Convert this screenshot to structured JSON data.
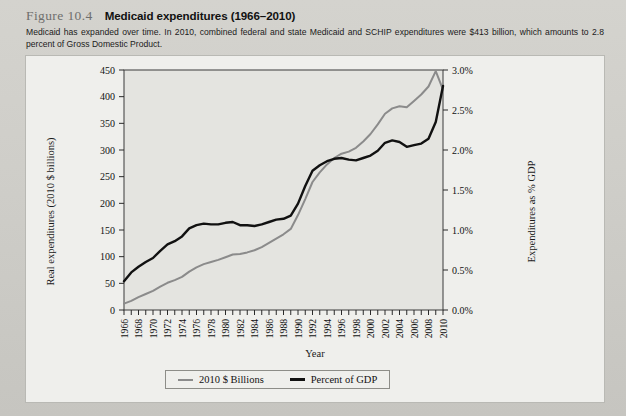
{
  "figure": {
    "number": "Figure 10.4",
    "title": "Medicaid expenditures (1966–2010)",
    "caption": "Medicaid has expanded over time. In 2010, combined federal and state Medicaid and SCHIP expenditures were $413 billion, which amounts to 2.8 percent of Gross Domestic Product."
  },
  "chart_data": {
    "type": "line",
    "title": "Medicaid expenditures (1966–2010)",
    "xlabel": "Year",
    "ylabel": "Real expenditures (2010 $ billions)",
    "y2label": "Expenditures as % GDP",
    "grid": false,
    "legend_position": "bottom",
    "xlim": [
      1966,
      2010
    ],
    "ylim": [
      0,
      450
    ],
    "y2lim": [
      0,
      3.0
    ],
    "yticks": [
      0,
      50,
      100,
      150,
      200,
      250,
      300,
      350,
      400,
      450
    ],
    "ytick_labels": [
      "0",
      "50",
      "100",
      "150",
      "200",
      "250",
      "300",
      "350",
      "400",
      "450"
    ],
    "y2ticks": [
      0,
      0.5,
      1.0,
      1.5,
      2.0,
      2.5,
      3.0
    ],
    "y2tick_labels": [
      "0.0%",
      "0.5%",
      "1.0%",
      "1.5%",
      "2.0%",
      "2.5%",
      "3.0%"
    ],
    "x": [
      1966,
      1967,
      1968,
      1969,
      1970,
      1971,
      1972,
      1973,
      1974,
      1975,
      1976,
      1977,
      1978,
      1979,
      1980,
      1981,
      1982,
      1983,
      1984,
      1985,
      1986,
      1987,
      1988,
      1989,
      1990,
      1991,
      1992,
      1993,
      1994,
      1995,
      1996,
      1997,
      1998,
      1999,
      2000,
      2001,
      2002,
      2003,
      2004,
      2005,
      2006,
      2007,
      2008,
      2009,
      2010
    ],
    "xtick_labels": [
      "1966",
      "1968",
      "1970",
      "1972",
      "1974",
      "1976",
      "1978",
      "1980",
      "1982",
      "1984",
      "1986",
      "1988",
      "1990",
      "1992",
      "1994",
      "1996",
      "1998",
      "2000",
      "2002",
      "2004",
      "2006",
      "2008",
      "2010"
    ],
    "series": [
      {
        "name": "2010 $ Billions",
        "axis": "left",
        "color": "#8b8b8b",
        "values": [
          12,
          17,
          24,
          30,
          36,
          44,
          51,
          56,
          62,
          72,
          80,
          86,
          90,
          94,
          99,
          104,
          105,
          108,
          112,
          118,
          126,
          134,
          142,
          152,
          178,
          208,
          240,
          258,
          273,
          285,
          293,
          297,
          304,
          316,
          330,
          348,
          368,
          378,
          382,
          380,
          392,
          404,
          419,
          448,
          413
        ]
      },
      {
        "name": "Percent of GDP",
        "axis": "right",
        "color": "#111111",
        "values": [
          0.36,
          0.47,
          0.54,
          0.6,
          0.65,
          0.74,
          0.82,
          0.86,
          0.92,
          1.02,
          1.06,
          1.08,
          1.07,
          1.07,
          1.09,
          1.1,
          1.06,
          1.06,
          1.05,
          1.07,
          1.1,
          1.13,
          1.14,
          1.18,
          1.33,
          1.55,
          1.74,
          1.81,
          1.86,
          1.89,
          1.9,
          1.88,
          1.87,
          1.9,
          1.93,
          1.99,
          2.09,
          2.12,
          2.1,
          2.04,
          2.06,
          2.08,
          2.14,
          2.35,
          2.8
        ]
      }
    ]
  },
  "legend": {
    "items": [
      {
        "label": "2010 $ Billions",
        "color": "#8b8b8b"
      },
      {
        "label": "Percent of GDP",
        "color": "#111111"
      }
    ]
  }
}
